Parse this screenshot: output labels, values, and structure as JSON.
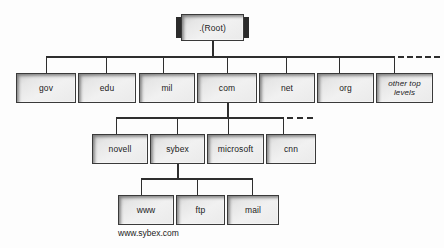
{
  "diagram": {
    "caption": "www.sybex.com",
    "root": {
      "label": ".(Root)"
    },
    "top_level": [
      {
        "label": "gov",
        "italic": false
      },
      {
        "label": "edu",
        "italic": false
      },
      {
        "label": "mil",
        "italic": false
      },
      {
        "label": "com",
        "italic": false
      },
      {
        "label": "net",
        "italic": false
      },
      {
        "label": "org",
        "italic": false
      },
      {
        "label": "other top levels",
        "italic": true
      }
    ],
    "second_level": [
      {
        "label": "novell"
      },
      {
        "label": "sybex"
      },
      {
        "label": "microsoft"
      },
      {
        "label": "cnn"
      }
    ],
    "third_level": [
      {
        "label": "www"
      },
      {
        "label": "ftp"
      },
      {
        "label": "mail"
      }
    ],
    "colors": {
      "box_fill": "#ebebeb",
      "box_border": "#3a3a3a",
      "line": "#2e2e2e",
      "text": "#1b1b1b",
      "background": "#fdfdfd"
    }
  }
}
